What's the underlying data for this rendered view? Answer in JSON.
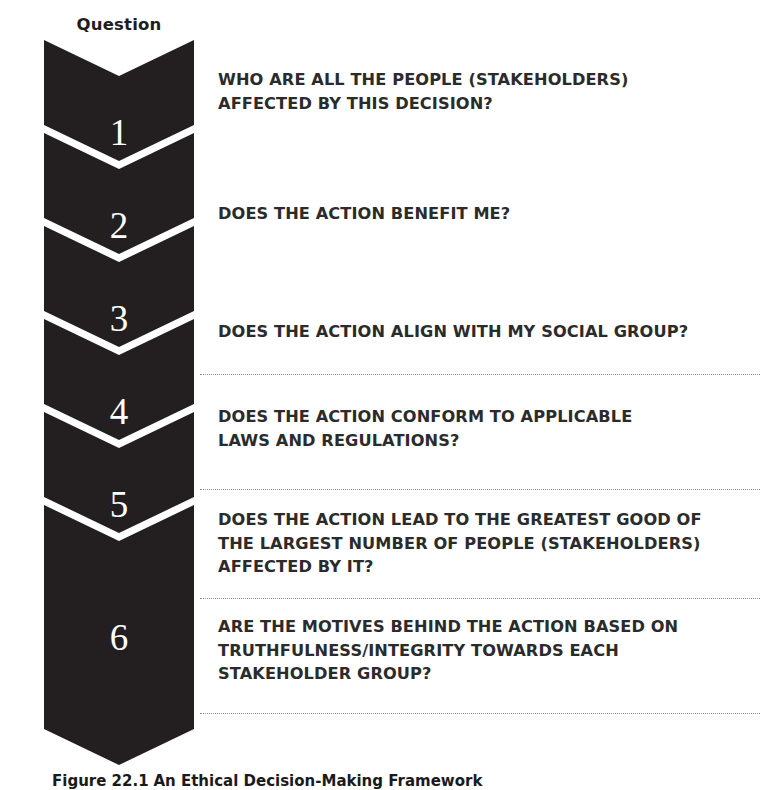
{
  "figure": {
    "column_header": "Question",
    "caption_label": "Figure 22.1",
    "caption_text": "An Ethical Decision-Making Framework",
    "colors": {
      "chevron_fill": "#231f20",
      "chevron_gap": "#ffffff",
      "number_text": "#ffffff",
      "body_text": "#2b2b2b",
      "separator": "#8e8e8e",
      "background": "#ffffff"
    }
  },
  "steps": [
    {
      "number": "1",
      "lines": [
        "WHO ARE ALL THE PEOPLE (STAKEHOLDERS)",
        "AFFECTED BY THIS DECISION?"
      ]
    },
    {
      "number": "2",
      "lines": [
        "DOES THE ACTION BENEFIT ME?"
      ]
    },
    {
      "number": "3",
      "lines": [
        "DOES THE ACTION ALIGN WITH MY SOCIAL GROUP?"
      ]
    },
    {
      "number": "4",
      "lines": [
        "DOES THE ACTION CONFORM TO APPLICABLE",
        "LAWS AND REGULATIONS?"
      ]
    },
    {
      "number": "5",
      "lines": [
        "DOES THE ACTION LEAD TO THE GREATEST GOOD OF",
        "THE LARGEST NUMBER OF PEOPLE (STAKEHOLDERS)",
        "AFFECTED BY IT?"
      ]
    },
    {
      "number": "6",
      "lines": [
        "ARE THE MOTIVES BEHIND THE ACTION BASED ON",
        "TRUTHFULNESS/INTEGRITY TOWARDS EACH",
        "STAKEHOLDER GROUP?"
      ]
    }
  ]
}
